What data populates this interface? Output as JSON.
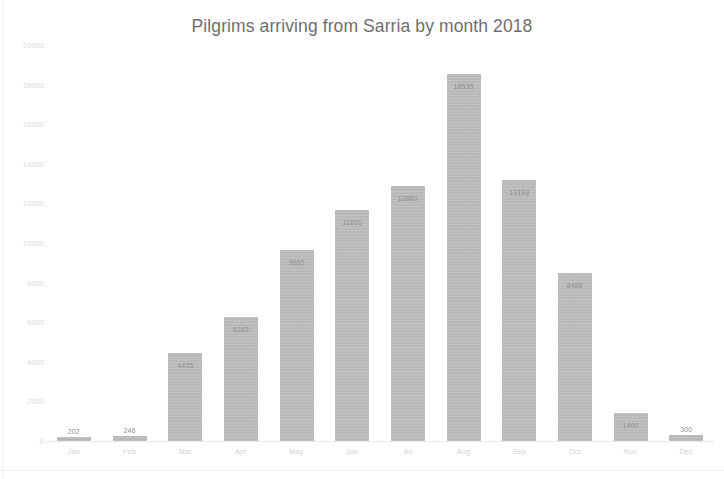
{
  "chart_data": {
    "type": "bar",
    "title": "Pilgrims arriving from Sarria by month 2018",
    "xlabel": "",
    "ylabel": "",
    "ylim": [
      0,
      20000
    ],
    "grid": false,
    "legend": false,
    "legend_position": "none",
    "bar_color": "#bcbcbc",
    "categories": [
      "Jan",
      "Feb",
      "Mar",
      "Apr",
      "May",
      "Jun",
      "Jul",
      "Aug",
      "Sep",
      "Oct",
      "Nov",
      "Dec"
    ],
    "values": [
      202,
      246,
      4435,
      6263,
      9665,
      11691,
      12880,
      18535,
      13193,
      8486,
      1400,
      300
    ],
    "value_labels": [
      "202",
      "246",
      "4435",
      "6263",
      "9665",
      "11691",
      "12880",
      "18535",
      "13193",
      "8486",
      "1400",
      "300"
    ],
    "ytick_labels": [
      "0",
      "2000",
      "4000",
      "6000",
      "8000",
      "10000",
      "12000",
      "14000",
      "16000",
      "18000",
      "20000"
    ],
    "ytick_values": [
      0,
      2000,
      4000,
      6000,
      8000,
      10000,
      12000,
      14000,
      16000,
      18000,
      20000
    ]
  },
  "colors": {
    "bar": "#bcbcbc",
    "title_text": "#6e6e6e",
    "axis_text": "#d6d6d6",
    "value_text": "#8f8f8f",
    "background": "#ffffff"
  }
}
